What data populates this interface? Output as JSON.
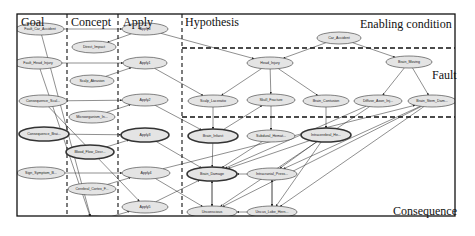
{
  "diagram": {
    "frame": {
      "x": 17,
      "y": 14,
      "w": 438,
      "h": 202
    },
    "columns": [
      {
        "id": "goal",
        "label": "Goal",
        "label_x": 21,
        "label_y": 26,
        "size": 12
      },
      {
        "id": "concept",
        "label": "Concept",
        "label_x": 71,
        "label_y": 26,
        "size": 12
      },
      {
        "id": "apply",
        "label": "Apply",
        "label_x": 123,
        "label_y": 26,
        "size": 12
      },
      {
        "id": "hypothesis",
        "label": "Hypothesis",
        "label_x": 185,
        "label_y": 26,
        "size": 12
      }
    ],
    "regions": [
      {
        "id": "enabling",
        "label": "Enabling condition",
        "label_x": 360,
        "label_y": 28,
        "size": 12
      },
      {
        "id": "fault",
        "label": "Fault",
        "label_x": 432,
        "label_y": 79,
        "size": 12
      },
      {
        "id": "consequence",
        "label": "Consequence",
        "label_x": 393,
        "label_y": 215,
        "size": 12
      }
    ],
    "dividers": {
      "vertical": [
        {
          "x": 67,
          "y1": 14,
          "y2": 216
        },
        {
          "x": 118,
          "y1": 14,
          "y2": 216
        },
        {
          "x": 182,
          "y1": 14,
          "y2": 216
        }
      ],
      "horizontal": [
        {
          "y": 48,
          "x1": 182,
          "x2": 455
        },
        {
          "y": 117,
          "x1": 182,
          "x2": 455
        }
      ]
    },
    "nodes": [
      {
        "id": "fault_car_accident",
        "label": "Fault_Car_Accident",
        "cx": 40,
        "cy": 29,
        "rx": 24,
        "ry": 6,
        "bold": false
      },
      {
        "id": "fault_head_injury",
        "label": "Fault_Head_Injury",
        "cx": 38,
        "cy": 63,
        "rx": 24,
        "ry": 6,
        "bold": false
      },
      {
        "id": "consequence_scal",
        "label": "Consequence_Scal...",
        "cx": 43,
        "cy": 101,
        "rx": 24,
        "ry": 6,
        "bold": false
      },
      {
        "id": "consequence_brai",
        "label": "Consequence_Brai...",
        "cx": 44,
        "cy": 134,
        "rx": 25,
        "ry": 7,
        "bold": true
      },
      {
        "id": "sign_symptom",
        "label": "Sign_Symptom_B...",
        "cx": 41,
        "cy": 173,
        "rx": 24,
        "ry": 6,
        "bold": false
      },
      {
        "id": "direct_impact",
        "label": "Direct_Impact",
        "cx": 94,
        "cy": 47,
        "rx": 22,
        "ry": 6,
        "bold": false
      },
      {
        "id": "scalp_abrasion",
        "label": "Scalp_Abrasion",
        "cx": 92,
        "cy": 81,
        "rx": 22,
        "ry": 6,
        "bold": false
      },
      {
        "id": "microorganism",
        "label": "Microorganism_In...",
        "cx": 92,
        "cy": 117,
        "rx": 23,
        "ry": 6,
        "bold": false
      },
      {
        "id": "blood_flow",
        "label": "Blood_Flow_Decr...",
        "cx": 90,
        "cy": 152,
        "rx": 24,
        "ry": 7,
        "bold": true
      },
      {
        "id": "cerebral_cortex",
        "label": "Cerebral_Cortex_F...",
        "cx": 92,
        "cy": 189,
        "rx": 24,
        "ry": 6,
        "bold": false
      },
      {
        "id": "concept_bottom",
        "label": "",
        "cx": 92,
        "cy": 222,
        "rx": 24,
        "ry": 6,
        "bold": false
      },
      {
        "id": "apply0",
        "label": "Apply0",
        "cx": 145,
        "cy": 29,
        "rx": 23,
        "ry": 6,
        "bold": false
      },
      {
        "id": "apply1",
        "label": "Apply1",
        "cx": 145,
        "cy": 63,
        "rx": 22,
        "ry": 6,
        "bold": false
      },
      {
        "id": "apply2",
        "label": "Apply2",
        "cx": 145,
        "cy": 100,
        "rx": 23,
        "ry": 6,
        "bold": false
      },
      {
        "id": "apply3",
        "label": "Apply3",
        "cx": 145,
        "cy": 135,
        "rx": 24,
        "ry": 7,
        "bold": true
      },
      {
        "id": "apply4",
        "label": "Apply4",
        "cx": 146,
        "cy": 173,
        "rx": 24,
        "ry": 6,
        "bold": false
      },
      {
        "id": "apply5",
        "label": "Apply5",
        "cx": 145,
        "cy": 207,
        "rx": 23,
        "ry": 6,
        "bold": false
      },
      {
        "id": "car_accident",
        "label": "Car_Accident",
        "cx": 339,
        "cy": 38,
        "rx": 22,
        "ry": 6,
        "bold": false
      },
      {
        "id": "head_injury",
        "label": "Head_Injury",
        "cx": 270,
        "cy": 63,
        "rx": 23,
        "ry": 6,
        "bold": false
      },
      {
        "id": "brain_moving",
        "label": "Brain_Moving",
        "cx": 409,
        "cy": 62,
        "rx": 23,
        "ry": 6,
        "bold": false
      },
      {
        "id": "scalp_laceratio",
        "label": "Scalp_Laceratio",
        "cx": 213,
        "cy": 101,
        "rx": 25,
        "ry": 6,
        "bold": false
      },
      {
        "id": "skull_fracture",
        "label": "Skull_Fracture",
        "cx": 271,
        "cy": 100,
        "rx": 24,
        "ry": 6,
        "bold": false
      },
      {
        "id": "brain_contusion",
        "label": "Brain_Contusion",
        "cx": 326,
        "cy": 101,
        "rx": 23,
        "ry": 6,
        "bold": false
      },
      {
        "id": "diffuse_axon",
        "label": "Diffuse_Axon_Inj...",
        "cx": 378,
        "cy": 101,
        "rx": 24,
        "ry": 6,
        "bold": false
      },
      {
        "id": "brain_stem_dam",
        "label": "Brain_Stem_Dam...",
        "cx": 432,
        "cy": 101,
        "rx": 24,
        "ry": 6,
        "bold": false
      },
      {
        "id": "brain_infarct",
        "label": "Brain_Infarct",
        "cx": 213,
        "cy": 136,
        "rx": 25,
        "ry": 7,
        "bold": true
      },
      {
        "id": "subdural_hemat",
        "label": "Subdural_Hemat...",
        "cx": 271,
        "cy": 136,
        "rx": 24,
        "ry": 6,
        "bold": false
      },
      {
        "id": "intracerebral_he",
        "label": "Intracerebral_He...",
        "cx": 326,
        "cy": 135,
        "rx": 25,
        "ry": 7,
        "bold": true
      },
      {
        "id": "brain_damage",
        "label": "Brain_Damage",
        "cx": 212,
        "cy": 174,
        "rx": 25,
        "ry": 7,
        "bold": true
      },
      {
        "id": "intracranial_press",
        "label": "Intracranial_Press...",
        "cx": 272,
        "cy": 174,
        "rx": 25,
        "ry": 6,
        "bold": false
      },
      {
        "id": "unconscious",
        "label": "Unconscious",
        "cx": 212,
        "cy": 212,
        "rx": 25,
        "ry": 6,
        "bold": false
      },
      {
        "id": "uncus_lobe_hern",
        "label": "Uncus_Lobe_Hern...",
        "cx": 272,
        "cy": 212,
        "rx": 25,
        "ry": 6,
        "bold": false
      }
    ],
    "edges": [
      [
        "fault_car_accident",
        "apply0"
      ],
      [
        "fault_head_injury",
        "apply1"
      ],
      [
        "consequence_scal",
        "apply2"
      ],
      [
        "consequence_brai",
        "apply3"
      ],
      [
        "sign_symptom",
        "apply4"
      ],
      [
        "apply0",
        "direct_impact"
      ],
      [
        "scalp_abrasion",
        "apply1"
      ],
      [
        "microorganism",
        "apply2"
      ],
      [
        "blood_flow",
        "apply3"
      ],
      [
        "cerebral_cortex",
        "apply4"
      ],
      [
        "concept_bottom",
        "apply5"
      ],
      [
        "fault_car_accident",
        "concept_bottom"
      ],
      [
        "fault_head_injury",
        "concept_bottom"
      ],
      [
        "consequence_scal",
        "apply5"
      ],
      [
        "apply0",
        "head_injury"
      ],
      [
        "apply1",
        "scalp_laceratio"
      ],
      [
        "apply2",
        "brain_infarct"
      ],
      [
        "apply3",
        "brain_damage"
      ],
      [
        "apply4",
        "unconscious"
      ],
      [
        "car_accident",
        "head_injury"
      ],
      [
        "car_accident",
        "brain_moving"
      ],
      [
        "head_injury",
        "scalp_laceratio"
      ],
      [
        "head_injury",
        "skull_fracture"
      ],
      [
        "head_injury",
        "brain_contusion"
      ],
      [
        "brain_moving",
        "diffuse_axon"
      ],
      [
        "brain_moving",
        "brain_stem_dam"
      ],
      [
        "scalp_laceratio",
        "brain_infarct"
      ],
      [
        "skull_fracture",
        "subdural_hemat"
      ],
      [
        "brain_contusion",
        "intracerebral_he"
      ],
      [
        "brain_infarct",
        "skull_fracture"
      ],
      [
        "brain_infarct",
        "brain_damage"
      ],
      [
        "subdural_hemat",
        "brain_damage"
      ],
      [
        "intracerebral_he",
        "brain_damage"
      ],
      [
        "intracerebral_he",
        "intracranial_press"
      ],
      [
        "intracerebral_he",
        "uncus_lobe_hern"
      ],
      [
        "diffuse_axon",
        "brain_damage"
      ],
      [
        "diffuse_axon",
        "unconscious"
      ],
      [
        "brain_stem_dam",
        "intracranial_press"
      ],
      [
        "brain_stem_dam",
        "uncus_lobe_hern"
      ],
      [
        "brain_stem_dam",
        "unconscious"
      ],
      [
        "intracranial_press",
        "brain_damage"
      ],
      [
        "intracranial_press",
        "uncus_lobe_hern"
      ],
      [
        "brain_damage",
        "unconscious"
      ],
      [
        "unconscious",
        "brain_damage"
      ],
      [
        "uncus_lobe_hern",
        "intracranial_press"
      ],
      [
        "uncus_lobe_hern",
        "unconscious"
      ],
      [
        "apply5",
        "brain_damage"
      ],
      [
        "apply4",
        "brain_stem_dam"
      ]
    ],
    "colors": {
      "node_fill": "#e4e4e4",
      "node_stroke": "#333333",
      "edge": "#333333",
      "frame": "#111111",
      "divider": "#111111"
    }
  }
}
